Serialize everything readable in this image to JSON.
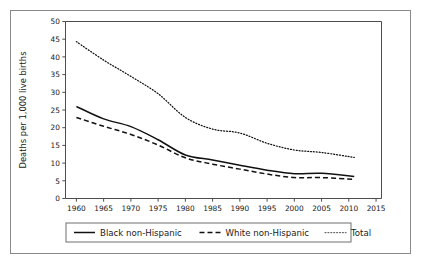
{
  "chart_data": {
    "type": "line",
    "title": "",
    "xlabel": "",
    "ylabel": "Deaths per 1,000 live births",
    "xlim": [
      1958,
      2016
    ],
    "ylim": [
      0,
      50
    ],
    "grid": false,
    "legend_position": "bottom-outside",
    "x_ticks": [
      1960,
      1965,
      1970,
      1975,
      1980,
      1985,
      1990,
      1995,
      2000,
      2005,
      2010,
      2015
    ],
    "x_tick_labels": [
      "1960",
      "1965",
      "1970",
      "1975",
      "1980",
      "1985",
      "1990",
      "1995",
      "2000",
      "2005",
      "2010",
      "2015"
    ],
    "y_ticks": [
      0,
      5,
      10,
      15,
      20,
      25,
      30,
      35,
      40,
      45,
      50
    ],
    "y_tick_labels": [
      "0",
      "5",
      "10",
      "15",
      "20",
      "25",
      "30",
      "35",
      "40",
      "45",
      "50"
    ],
    "x": [
      1960,
      1965,
      1970,
      1975,
      1980,
      1985,
      1990,
      1995,
      2000,
      2005,
      2011
    ],
    "series": [
      {
        "name": "Black non-Hispanic",
        "style": "solid",
        "color": "#111111",
        "values": [
          26.0,
          22.5,
          20.3,
          16.6,
          12.3,
          10.9,
          9.4,
          8.0,
          7.0,
          7.1,
          6.2
        ]
      },
      {
        "name": "White non-Hispanic",
        "style": "dashed",
        "color": "#111111",
        "values": [
          22.9,
          20.4,
          18.1,
          15.1,
          11.5,
          9.7,
          8.3,
          6.9,
          5.9,
          5.9,
          5.4
        ]
      },
      {
        "name": "Total",
        "style": "dotted",
        "color": "#6b6b6b",
        "values": [
          44.3,
          39.1,
          34.5,
          29.6,
          22.9,
          19.6,
          18.5,
          15.6,
          13.7,
          13.0,
          11.6
        ]
      }
    ]
  },
  "legend": {
    "entries": [
      {
        "label": "Black non-Hispanic",
        "style": "solid"
      },
      {
        "label": "White non-Hispanic",
        "style": "dashed"
      },
      {
        "label": "Total",
        "style": "dotted"
      }
    ]
  }
}
